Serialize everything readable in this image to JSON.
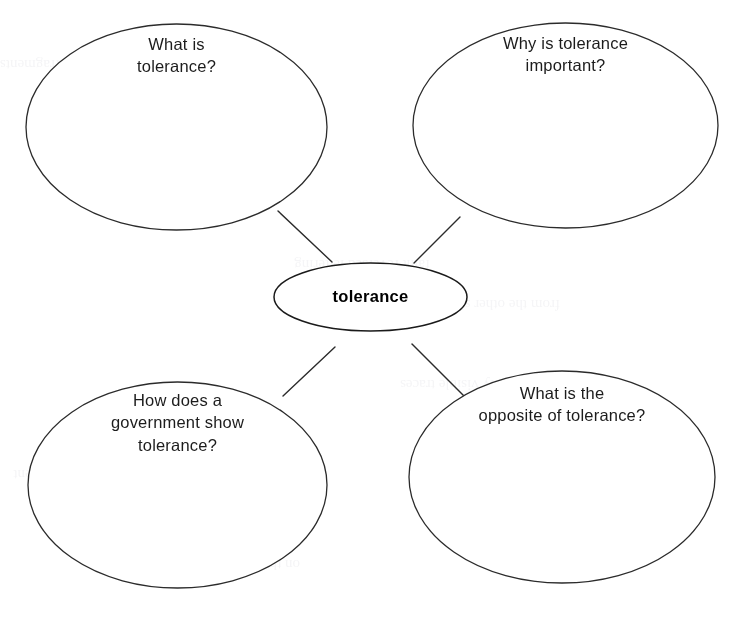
{
  "page": {
    "background_color": "#ffffff",
    "line_color": "#2b2b2b",
    "text_color": "#1c1c1c",
    "center_text_color": "#000000"
  },
  "center": {
    "label": "tolerance"
  },
  "nodes": [
    {
      "id": "topleft",
      "label": "What is\ntolerance?"
    },
    {
      "id": "topright",
      "label": "Why is tolerance\nimportant?"
    },
    {
      "id": "bottomleft",
      "label": "How does a\ngovernment show\ntolerance?"
    },
    {
      "id": "bottomright",
      "label": "What is the\nopposite of tolerance?"
    }
  ]
}
